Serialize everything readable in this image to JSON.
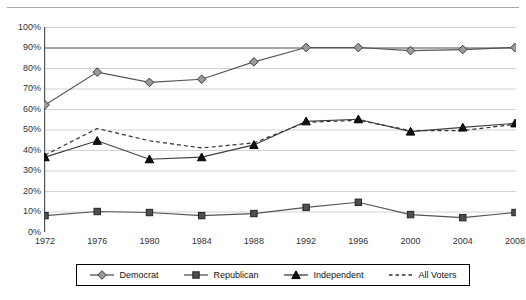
{
  "chart": {
    "title": "1972-2008",
    "ylabel": "",
    "xlabel": ""
  },
  "legend": {
    "entries": [
      {
        "label": "Democrat",
        "marker": "diamond-marker",
        "line": "solid",
        "color": "#4a4a4a"
      },
      {
        "label": "Republican",
        "marker": "square-marker",
        "line": "solid",
        "color": "#3a3a3a"
      },
      {
        "label": "Independent",
        "marker": "triangle-marker",
        "line": "solid",
        "color": "#1a1a1a"
      },
      {
        "label": "All Voters",
        "marker": "none",
        "line": "dashed",
        "color": "#333333"
      }
    ]
  },
  "y_axis": {
    "ticks": [
      "0%",
      "10%",
      "20%",
      "30%",
      "40%",
      "50%",
      "60%",
      "70%",
      "80%",
      "90%",
      "100%"
    ]
  },
  "x_axis": {
    "ticks": [
      "1972",
      "1976",
      "1980",
      "1984",
      "1988",
      "1992",
      "1996",
      "2000",
      "2004",
      "2008"
    ]
  },
  "chart_data": {
    "type": "line",
    "title": "1972-2008",
    "xlabel": "",
    "ylabel": "",
    "ylim": [
      0,
      100
    ],
    "ytick_step": 10,
    "grid": true,
    "legend_position": "bottom",
    "categories": [
      "1972",
      "1976",
      "1980",
      "1984",
      "1988",
      "1992",
      "1996",
      "2000",
      "2004",
      "2008"
    ],
    "series": [
      {
        "name": "Democrat",
        "marker": "diamond",
        "linestyle": "solid",
        "values": [
          62,
          78,
          73,
          74.5,
          83,
          90,
          90,
          88.5,
          89,
          90
        ]
      },
      {
        "name": "Republican",
        "marker": "square",
        "linestyle": "solid",
        "values": [
          8,
          10,
          9.5,
          8,
          9,
          12,
          14.5,
          8.5,
          7,
          9.5
        ]
      },
      {
        "name": "Independent",
        "marker": "triangle",
        "linestyle": "solid",
        "values": [
          36.5,
          44.5,
          35.5,
          36.5,
          42.5,
          54,
          55,
          49,
          51,
          53
        ]
      },
      {
        "name": "All Voters",
        "marker": "none",
        "linestyle": "dashed",
        "values": [
          37.5,
          50.5,
          44.5,
          41,
          43.5,
          53.5,
          54.5,
          49.5,
          49.5,
          52.5
        ]
      }
    ]
  }
}
